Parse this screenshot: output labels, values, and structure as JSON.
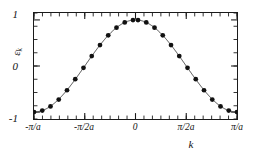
{
  "chart_data": {
    "type": "line",
    "title": "",
    "subtitle": "",
    "xlabel": "k",
    "ylabel": "ε",
    "ylabel_sub": "k",
    "xlim": [
      -3.14159265,
      3.14159265
    ],
    "ylim": [
      -1.15,
      1.15
    ],
    "grid": false,
    "legend": null,
    "x_tick_labels": [
      "-π/a",
      "-π/2a",
      "0",
      "π/2a",
      "π/a"
    ],
    "x_tick_values": [
      -3.14159265,
      -1.57079633,
      0,
      1.57079633,
      3.14159265
    ],
    "y_tick_labels": [
      "1",
      "0",
      "-1"
    ],
    "y_tick_values": [
      1,
      0,
      -1
    ],
    "x_minor_tick_count": 24,
    "y_minor_tick_count": 8,
    "marker_style": "filled-circle",
    "marker_color": "#111111",
    "line_color": "#333333",
    "background_color": "#ffffff",
    "axis_color": "#1a1a1a",
    "series": [
      {
        "name": "ε_k = cos(ka)",
        "x": [
          -3.14159265,
          -2.88626667,
          -2.63094069,
          -2.37561471,
          -2.12028873,
          -1.86496275,
          -1.60963677,
          -1.35431079,
          -1.09898481,
          -0.84365883,
          -0.58833285,
          -0.33300687,
          -0.07768089,
          0.07768089,
          0.33300687,
          0.58833285,
          0.84365883,
          1.09898481,
          1.35431079,
          1.60963677,
          1.86496275,
          2.12028873,
          2.37561471,
          2.63094069,
          2.88626667,
          3.14159265
        ],
        "y": [
          -1.0,
          -0.9682,
          -0.8763,
          -0.729,
          -0.5264,
          -0.2868,
          -0.0385,
          0.2153,
          0.454,
          0.6648,
          0.832,
          0.945,
          0.997,
          0.997,
          0.945,
          0.832,
          0.6648,
          0.454,
          0.2153,
          -0.0385,
          -0.2868,
          -0.5264,
          -0.729,
          -0.8763,
          -0.9682,
          -1.0
        ]
      }
    ],
    "curve": {
      "name": "cos(ka)",
      "description": "continuous cosine tight-binding dispersion band"
    }
  }
}
